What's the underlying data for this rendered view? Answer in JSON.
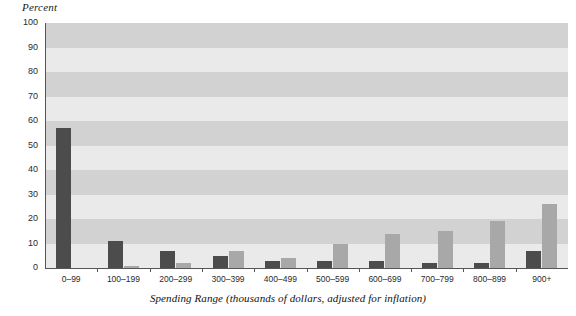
{
  "chart_data": {
    "type": "bar",
    "title": "",
    "ylabel": "Percent",
    "xlabel": "Spending Range (thousands of dollars, adjusted for inflation)",
    "categories": [
      "0–99",
      "100–199",
      "200–299",
      "300–399",
      "400–499",
      "500–599",
      "600–699",
      "700–799",
      "800–899",
      "900+"
    ],
    "series": [
      {
        "name": "series-1-dark",
        "color": "#4c4c4c",
        "values": [
          57,
          11,
          7,
          5,
          3,
          3,
          3,
          2,
          2,
          7
        ]
      },
      {
        "name": "series-2-light",
        "color": "#a8a8a8",
        "values": [
          0,
          1,
          2,
          7,
          4,
          10,
          14,
          15,
          19,
          26
        ]
      }
    ],
    "ylim": [
      0,
      100
    ],
    "ytick_values": [
      0,
      10,
      20,
      30,
      40,
      50,
      60,
      70,
      80,
      90,
      100
    ],
    "ytick_labels": [
      "0",
      "10",
      "20",
      "30",
      "40",
      "50",
      "60",
      "70",
      "80",
      "90",
      "100"
    ],
    "grid": "horizontal-bands",
    "legend": "none",
    "background_bands": {
      "light": "#eaeaea",
      "dark": "#d2d2d2"
    },
    "axis_color": "#555555"
  }
}
